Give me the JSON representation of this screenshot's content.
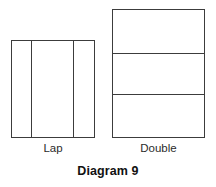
{
  "caption": "Diagram 9",
  "colors": {
    "background": "#ffffff",
    "stroke": "#3c3c3c",
    "label_text": "#2b2b2b",
    "caption_text": "#111111"
  },
  "figures": [
    {
      "id": "lap",
      "label": "Lap",
      "shape": "rectangle",
      "division": "vertical",
      "panels": 3,
      "divider_positions": [
        0.226,
        0.726
      ],
      "geometry": {
        "x": 11,
        "y": 40,
        "width": 84,
        "height": 98
      }
    },
    {
      "id": "double",
      "label": "Double",
      "shape": "rectangle",
      "division": "horizontal",
      "panels": 3,
      "divider_positions": [
        0.333,
        0.651
      ],
      "geometry": {
        "x": 112,
        "y": 9,
        "width": 93,
        "height": 129
      }
    }
  ]
}
